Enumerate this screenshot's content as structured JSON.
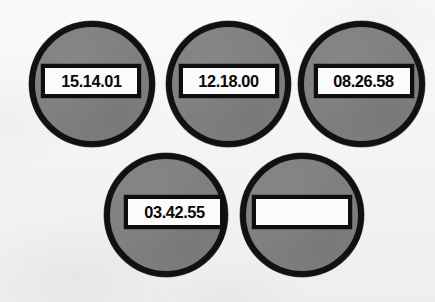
{
  "scene": {
    "title": "Timestamp marker discs",
    "background_color": "#f6f5f3",
    "disc_fill_color": "#808080",
    "disc_outline_color": "#111111",
    "plate_fill_color": "#fbfbfb",
    "plate_outline_color": "#0e0e0e",
    "text_color": "#080808",
    "marker_count": "5"
  },
  "markers": [
    {
      "id": "marker-1",
      "position": "top-left",
      "code": "15.14.01",
      "empty": "false"
    },
    {
      "id": "marker-2",
      "position": "top-center",
      "code": "12.18.00",
      "empty": "false"
    },
    {
      "id": "marker-3",
      "position": "top-right",
      "code": "08.26.58",
      "empty": "false"
    },
    {
      "id": "marker-4",
      "position": "bottom-left",
      "code": "03.42.55",
      "empty": "false"
    },
    {
      "id": "marker-5",
      "position": "bottom-right",
      "code": "",
      "empty": "true"
    }
  ]
}
